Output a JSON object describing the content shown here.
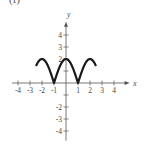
{
  "panel_label": "(f)",
  "chart_data": {
    "type": "line",
    "title": "",
    "xlabel": "x",
    "ylabel": "y",
    "xlim": [
      -4.5,
      5
    ],
    "ylim": [
      -4.8,
      5
    ],
    "x_ticks": [
      -4,
      -3,
      -2,
      -1,
      1,
      2,
      3,
      4
    ],
    "x_tick_labels": [
      "-4",
      "-3",
      "-2",
      "-1",
      "1",
      "2",
      "3",
      "4"
    ],
    "y_ticks": [
      -4,
      -3,
      -2,
      -1,
      1,
      2,
      3,
      4
    ],
    "y_tick_labels": [
      "-4",
      "-3",
      "-2",
      "",
      "",
      "2",
      "3",
      "4"
    ],
    "grid": false,
    "series": [
      {
        "name": "y = 2|cos(πx/2)|",
        "x": [
          -2.5,
          -2.25,
          -2,
          -1.75,
          -1.5,
          -1.25,
          -1,
          -0.75,
          -0.5,
          -0.25,
          0,
          0.25,
          0.5,
          0.75,
          1,
          1.25,
          1.5,
          1.75,
          2,
          2.25,
          2.5
        ],
        "y": [
          1.41,
          1.85,
          2,
          1.85,
          1.41,
          0.77,
          0,
          0.77,
          1.41,
          1.85,
          2,
          1.85,
          1.41,
          0.77,
          0,
          0.77,
          1.41,
          1.85,
          2,
          1.85,
          1.41
        ]
      }
    ]
  }
}
